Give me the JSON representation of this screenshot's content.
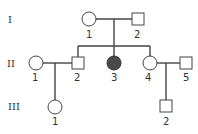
{
  "pedigree": {
    "generations": [
      {
        "label": "I"
      },
      {
        "label": "II"
      },
      {
        "label": "III"
      }
    ],
    "individuals": {
      "I_1": {
        "label": "1",
        "sex": "female",
        "affected": false
      },
      "I_2": {
        "label": "2",
        "sex": "male",
        "affected": false
      },
      "II_1": {
        "label": "1",
        "sex": "female",
        "affected": false
      },
      "II_2": {
        "label": "2",
        "sex": "male",
        "affected": false
      },
      "II_3": {
        "label": "3",
        "sex": "female",
        "affected": true
      },
      "II_4": {
        "label": "4",
        "sex": "female",
        "affected": false
      },
      "II_5": {
        "label": "5",
        "sex": "male",
        "affected": false
      },
      "III_1": {
        "label": "1",
        "sex": "female",
        "affected": false
      },
      "III_2": {
        "label": "2",
        "sex": "male",
        "affected": false
      }
    },
    "colors": {
      "line": "#444444",
      "affected_fill": "#4a4a4a",
      "unaffected_fill": "#ffffff"
    }
  }
}
